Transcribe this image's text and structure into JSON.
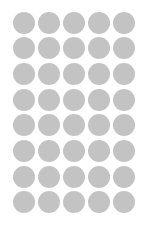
{
  "sheet": {
    "title": "Dot Grid Sheet",
    "width_px": 147,
    "height_px": 226,
    "background_color": "#ffffff",
    "description": "Grid of plain gray circular dots on a white sheet"
  },
  "grid": {
    "columns": 5,
    "rows": 8,
    "total_dots": 40,
    "dot_color": "#c2c2c2",
    "dot_diameter_px": 22,
    "column_pitch_px": 25,
    "row_pitch_px": 25.7,
    "offset_left_px": 11,
    "offset_top_px": 10,
    "margin_right_px": 11,
    "margin_bottom_px": 11,
    "dot_shape": "circle",
    "edge_style": "soft"
  },
  "chart_data": {
    "type": "scatter",
    "title": "",
    "xlabel": "",
    "ylabel": "",
    "grid": false,
    "legend": "none",
    "xlim": [
      0,
      147
    ],
    "ylim": [
      0,
      226
    ],
    "marker": "circle",
    "marker_color": "#c2c2c2",
    "marker_size_px": 22,
    "series": [
      {
        "name": "dots",
        "points": [
          [
            22,
            21
          ],
          [
            47,
            21
          ],
          [
            72,
            21
          ],
          [
            97,
            21
          ],
          [
            123,
            21
          ],
          [
            22,
            47
          ],
          [
            47,
            47
          ],
          [
            72,
            47
          ],
          [
            97,
            47
          ],
          [
            123,
            47
          ],
          [
            22,
            72
          ],
          [
            47,
            72
          ],
          [
            72,
            72
          ],
          [
            97,
            72
          ],
          [
            123,
            72
          ],
          [
            22,
            98
          ],
          [
            47,
            98
          ],
          [
            72,
            98
          ],
          [
            97,
            98
          ],
          [
            123,
            98
          ],
          [
            22,
            124
          ],
          [
            47,
            124
          ],
          [
            72,
            124
          ],
          [
            97,
            124
          ],
          [
            123,
            124
          ],
          [
            22,
            149
          ],
          [
            47,
            149
          ],
          [
            72,
            149
          ],
          [
            97,
            149
          ],
          [
            123,
            149
          ],
          [
            22,
            175
          ],
          [
            47,
            175
          ],
          [
            72,
            175
          ],
          [
            97,
            175
          ],
          [
            123,
            175
          ],
          [
            22,
            201
          ],
          [
            47,
            201
          ],
          [
            72,
            201
          ],
          [
            97,
            201
          ],
          [
            123,
            201
          ]
        ]
      }
    ]
  }
}
